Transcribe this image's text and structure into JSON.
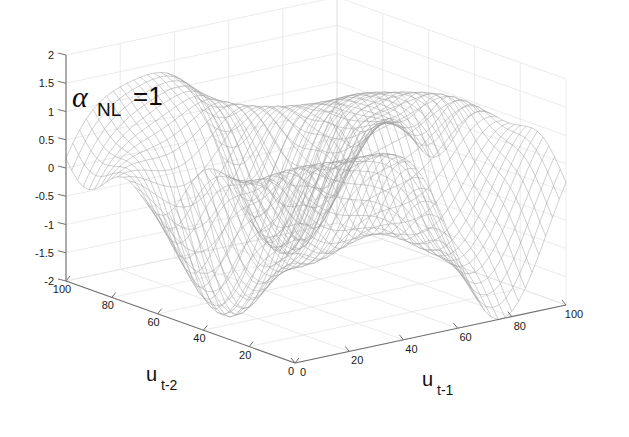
{
  "figure": {
    "type": "3d-mesh-surface",
    "background_color": "#ffffff",
    "mesh_color": "#9a9a9a",
    "axis_color": "#6e6e6e",
    "grid_color": "#e2e2e2",
    "text_color": "#111111"
  },
  "annotation": {
    "alpha_symbol": "α",
    "subscript": "NL",
    "equals_value": "=1",
    "full_text": "α_NL=1"
  },
  "axes": {
    "z": {
      "label": "",
      "ticks": [
        "2",
        "1.5",
        "1",
        "0.5",
        "0",
        "-0.5",
        "-1",
        "-1.5",
        "-2"
      ],
      "values": [
        2,
        1.5,
        1,
        0.5,
        0,
        -0.5,
        -1,
        -1.5,
        -2
      ],
      "min": -2,
      "max": 2,
      "step": 0.5
    },
    "x": {
      "label_main": "u",
      "label_sub": "t-1",
      "label": "u_t-1",
      "ticks": [
        "0",
        "20",
        "40",
        "60",
        "80",
        "100"
      ],
      "values": [
        0,
        20,
        40,
        60,
        80,
        100
      ],
      "min": 0,
      "max": 100,
      "step": 20
    },
    "y": {
      "label_main": "u",
      "label_sub": "t-2",
      "label": "u_t-2",
      "ticks": [
        "0",
        "20",
        "40",
        "60",
        "80",
        "100"
      ],
      "values": [
        0,
        20,
        40,
        60,
        80,
        100
      ],
      "min": 0,
      "max": 100,
      "step": 20
    }
  },
  "chart_data": {
    "type": "surface",
    "title": "",
    "subtitle": "",
    "xlabel": "u_t-1",
    "ylabel": "u_t-2",
    "zlabel": "",
    "xlim": [
      0,
      100
    ],
    "ylim": [
      0,
      100
    ],
    "zlim": [
      -2,
      2
    ],
    "grid": true,
    "legend": "none",
    "annotations": [
      "α_NL=1"
    ],
    "x_ticks": [
      0,
      20,
      40,
      60,
      80,
      100
    ],
    "y_ticks": [
      0,
      20,
      40,
      60,
      80,
      100
    ],
    "z_ticks": [
      -2,
      -1.5,
      -1,
      -0.5,
      0,
      0.5,
      1,
      1.5,
      2
    ],
    "mesh_resolution": [
      41,
      41
    ],
    "surface_description": "Smooth undulating nonlinear wave surface with two broad ridges and intervening troughs; amplitude roughly within -1.5 to 1.5, a prominent crest near the centre-back and a deep valley dropping toward the right-front corner.",
    "z_formula": "z = sin(2*pi*x/100)*cos(2*pi*y/100)*1.1 + 0.55*sin(2*pi*(x+y)/100) + 0.35*cos(2*pi*x/50)",
    "z_range_observed": [
      -1.6,
      1.5
    ]
  }
}
